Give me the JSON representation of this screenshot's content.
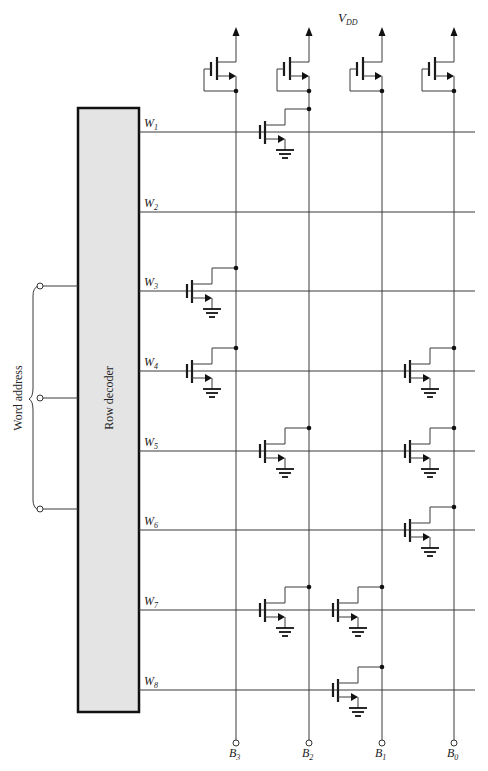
{
  "diagram": {
    "supply_label": {
      "main": "V",
      "sub": "DD"
    },
    "decoder_label": "Row decoder",
    "address_label": "Word address",
    "address_inputs": 3,
    "word_lines": [
      {
        "main": "W",
        "sub": "1"
      },
      {
        "main": "W",
        "sub": "2"
      },
      {
        "main": "W",
        "sub": "3"
      },
      {
        "main": "W",
        "sub": "4"
      },
      {
        "main": "W",
        "sub": "5"
      },
      {
        "main": "W",
        "sub": "6"
      },
      {
        "main": "W",
        "sub": "7"
      },
      {
        "main": "W",
        "sub": "8"
      }
    ],
    "bit_lines": [
      {
        "main": "B",
        "sub": "3"
      },
      {
        "main": "B",
        "sub": "2"
      },
      {
        "main": "B",
        "sub": "1"
      },
      {
        "main": "B",
        "sub": "0"
      }
    ],
    "cell_transistors": [
      {
        "word": 1,
        "bit": "B2"
      },
      {
        "word": 3,
        "bit": "B3"
      },
      {
        "word": 4,
        "bit": "B3"
      },
      {
        "word": 4,
        "bit": "B0"
      },
      {
        "word": 5,
        "bit": "B2"
      },
      {
        "word": 5,
        "bit": "B0"
      },
      {
        "word": 6,
        "bit": "B0"
      },
      {
        "word": 7,
        "bit": "B2"
      },
      {
        "word": 7,
        "bit": "B1"
      },
      {
        "word": 8,
        "bit": "B1"
      }
    ],
    "colors": {
      "decoder_fill": "#e4e4e4",
      "ink": "#222222"
    }
  }
}
